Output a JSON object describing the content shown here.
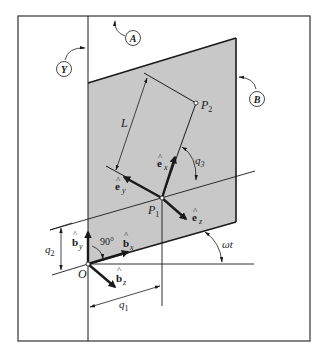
{
  "figure": {
    "frames": {
      "Y": "Y",
      "A": "A",
      "B": "B"
    },
    "points": {
      "origin": "O",
      "p1": "P",
      "p1_sub": "1",
      "p2": "P",
      "p2_sub": "2"
    },
    "vectors": {
      "ex": "e",
      "ex_sub": "x",
      "ey": "e",
      "ey_sub": "y",
      "ez": "e",
      "ez_sub": "z",
      "bx": "b",
      "bx_sub": "x",
      "by": "b",
      "by_sub": "y",
      "bz": "b",
      "bz_sub": "z",
      "hat": "^"
    },
    "dimensions": {
      "length": "L",
      "q1": "q",
      "q1_sub": "1",
      "q2": "q",
      "q2_sub": "2",
      "q3": "q",
      "q3_sub": "3",
      "right_angle": "90°",
      "omega_t": "ωt"
    },
    "colors": {
      "plate_fill": "#c8c8c8",
      "line": "#1a1a1a",
      "frame": "#333333"
    }
  }
}
